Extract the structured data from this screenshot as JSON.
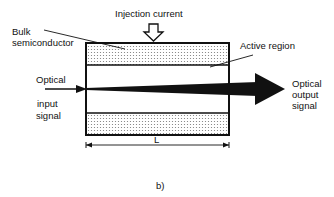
{
  "diagram": {
    "labels": {
      "injection_current": "Injection current",
      "bulk_line1": "Bulk",
      "bulk_line2": "semiconductor",
      "active_region": "Active region",
      "input_line1": "Optical",
      "input_line2": "input",
      "input_line3": "signal",
      "output_line1": "Optical",
      "output_line2": "output",
      "output_line3": "signal",
      "length": "L",
      "caption": "b)"
    },
    "colors": {
      "stroke": "#111111",
      "fill_dots": "#888888",
      "background": "#ffffff"
    }
  }
}
